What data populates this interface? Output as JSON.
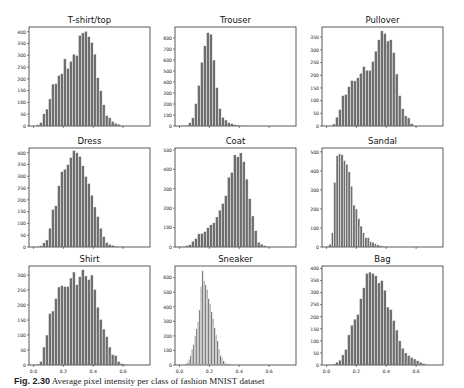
{
  "figure": {
    "caption_label": "Fig. 2.30",
    "caption_text": "Average pixel intensity per class of fashion MNIST dataset"
  },
  "style": {
    "bar_color": "#6e6e6e",
    "bar_edge": "#ffffff",
    "axis_color": "#333333"
  },
  "chart_data": [
    {
      "type": "bar",
      "title": "T-shirt/top",
      "xlabel": "",
      "ylabel": "",
      "xlim": [
        -0.03,
        0.78
      ],
      "ylim": [
        0,
        420
      ],
      "xticks": [
        0.0,
        0.2,
        0.4,
        0.6
      ],
      "xtick_labels": [],
      "yticks": [
        0,
        50,
        100,
        150,
        200,
        250,
        300,
        350,
        400
      ],
      "bin_start": 0.02,
      "bin_width": 0.02,
      "values": [
        5,
        15,
        52,
        72,
        115,
        178,
        180,
        215,
        222,
        285,
        245,
        275,
        305,
        300,
        385,
        395,
        402,
        380,
        355,
        305,
        205,
        150,
        90,
        45,
        35,
        20,
        12,
        8,
        3
      ]
    },
    {
      "type": "bar",
      "title": "Trouser",
      "xlabel": "",
      "ylabel": "",
      "xlim": [
        -0.03,
        0.78
      ],
      "ylim": [
        0,
        900
      ],
      "xticks": [
        0.0,
        0.2,
        0.4,
        0.6
      ],
      "xtick_labels": [],
      "yticks": [
        0,
        100,
        200,
        300,
        400,
        500,
        600,
        700,
        800
      ],
      "bin_start": 0.0,
      "bin_width": 0.02,
      "values": [
        2,
        4,
        8,
        30,
        75,
        205,
        370,
        580,
        730,
        850,
        835,
        600,
        350,
        160,
        80,
        55,
        30,
        22,
        12,
        8,
        5,
        3,
        2
      ]
    },
    {
      "type": "bar",
      "title": "Pullover",
      "xlabel": "",
      "ylabel": "",
      "xlim": [
        -0.03,
        0.78
      ],
      "ylim": [
        0,
        390
      ],
      "xticks": [
        0.0,
        0.2,
        0.4,
        0.6
      ],
      "xtick_labels": [],
      "yticks": [
        0,
        50,
        100,
        150,
        200,
        250,
        300,
        350
      ],
      "bin_start": 0.04,
      "bin_width": 0.02,
      "values": [
        8,
        35,
        65,
        120,
        125,
        155,
        180,
        178,
        190,
        208,
        235,
        220,
        220,
        255,
        295,
        340,
        375,
        365,
        335,
        340,
        290,
        205,
        120,
        68,
        40,
        32,
        10,
        3
      ]
    },
    {
      "type": "bar",
      "title": "Dress",
      "xlabel": "",
      "ylabel": "",
      "xlim": [
        -0.03,
        0.78
      ],
      "ylim": [
        0,
        420
      ],
      "xticks": [
        0.0,
        0.2,
        0.4,
        0.6
      ],
      "xtick_labels": [],
      "yticks": [
        0,
        50,
        100,
        150,
        200,
        250,
        300,
        350,
        400
      ],
      "bin_start": 0.0,
      "bin_width": 0.02,
      "values": [
        2,
        3,
        5,
        18,
        30,
        80,
        160,
        175,
        260,
        320,
        330,
        350,
        380,
        410,
        400,
        385,
        345,
        300,
        270,
        220,
        170,
        130,
        80,
        45,
        20,
        12,
        8,
        4,
        2,
        1
      ]
    },
    {
      "type": "bar",
      "title": "Coat",
      "xlabel": "",
      "ylabel": "",
      "xlim": [
        -0.03,
        0.78
      ],
      "ylim": [
        0,
        510
      ],
      "xticks": [
        0.0,
        0.2,
        0.4,
        0.6
      ],
      "xtick_labels": [],
      "yticks": [
        0,
        100,
        200,
        300,
        400,
        500
      ],
      "bin_start": 0.0,
      "bin_width": 0.02,
      "values": [
        2,
        3,
        8,
        12,
        30,
        45,
        68,
        70,
        80,
        100,
        115,
        125,
        155,
        190,
        225,
        265,
        360,
        385,
        475,
        465,
        485,
        440,
        350,
        250,
        160,
        85,
        25,
        15,
        8,
        3
      ]
    },
    {
      "type": "bar",
      "title": "Sandal",
      "xlabel": "",
      "ylabel": "",
      "xlim": [
        -0.03,
        0.78
      ],
      "ylim": [
        0,
        520
      ],
      "xticks": [
        0.0,
        0.2,
        0.4,
        0.6
      ],
      "xtick_labels": [],
      "yticks": [
        0,
        100,
        200,
        300,
        400,
        500
      ],
      "bin_start": 0.0,
      "bin_width": 0.016,
      "values": [
        5,
        15,
        75,
        340,
        480,
        490,
        485,
        455,
        435,
        395,
        320,
        220,
        200,
        150,
        110,
        75,
        50,
        50,
        30,
        25,
        18,
        12,
        8,
        5,
        3,
        2
      ]
    },
    {
      "type": "bar",
      "title": "Shirt",
      "xlabel": "",
      "ylabel": "",
      "xlim": [
        -0.03,
        0.78
      ],
      "ylim": [
        0,
        330
      ],
      "xticks": [
        0.0,
        0.2,
        0.4,
        0.6
      ],
      "xtick_labels": [
        "0.0",
        "0.2",
        "0.4",
        "0.6"
      ],
      "yticks": [
        0,
        50,
        100,
        150,
        200,
        250,
        300
      ],
      "bin_start": 0.0,
      "bin_width": 0.02,
      "values": [
        2,
        3,
        12,
        60,
        100,
        172,
        180,
        222,
        260,
        265,
        262,
        262,
        290,
        310,
        268,
        295,
        318,
        297,
        285,
        300,
        252,
        193,
        152,
        120,
        95,
        60,
        35,
        32,
        12,
        5,
        3,
        2
      ]
    },
    {
      "type": "bar",
      "title": "Sneaker",
      "xlabel": "",
      "ylabel": "",
      "xlim": [
        -0.03,
        0.78
      ],
      "ylim": [
        0,
        680
      ],
      "xticks": [
        0.0,
        0.2,
        0.4,
        0.6
      ],
      "xtick_labels": [
        "0.0",
        "0.2",
        "0.4",
        "0.6"
      ],
      "yticks": [
        0,
        100,
        200,
        300,
        400,
        500,
        600
      ],
      "bin_start": 0.0,
      "bin_width": 0.01,
      "values": [
        1,
        2,
        3,
        5,
        8,
        20,
        40,
        70,
        110,
        145,
        200,
        250,
        300,
        380,
        540,
        650,
        580,
        555,
        520,
        460,
        420,
        370,
        320,
        260,
        210,
        170,
        110,
        70,
        50,
        30,
        20,
        15,
        10,
        7,
        5,
        3,
        2,
        2,
        1
      ]
    },
    {
      "type": "bar",
      "title": "Bag",
      "xlabel": "",
      "ylabel": "",
      "xlim": [
        -0.03,
        0.78
      ],
      "ylim": [
        0,
        410
      ],
      "xticks": [
        0.0,
        0.2,
        0.4,
        0.6
      ],
      "xtick_labels": [
        "0.0",
        "0.2",
        "0.4",
        "0.6"
      ],
      "yticks": [
        0,
        50,
        100,
        150,
        200,
        250,
        300,
        350,
        400
      ],
      "bin_start": 0.0,
      "bin_width": 0.02,
      "values": [
        1,
        2,
        4,
        12,
        20,
        42,
        65,
        125,
        165,
        190,
        210,
        275,
        320,
        380,
        385,
        380,
        370,
        340,
        350,
        310,
        240,
        230,
        185,
        145,
        100,
        70,
        50,
        40,
        32,
        25,
        18,
        12,
        7,
        3
      ]
    }
  ]
}
